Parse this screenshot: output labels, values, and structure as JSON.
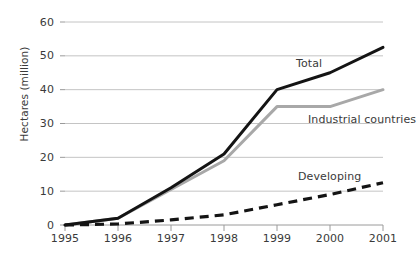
{
  "chart_data": {
    "type": "line",
    "title": "",
    "xlabel": "",
    "ylabel": "Hectares (million)",
    "x": [
      1995,
      1996,
      1997,
      1998,
      1999,
      2000,
      2001
    ],
    "xtick_labels": [
      "1995",
      "1996",
      "1997",
      "1998",
      "1999",
      "2000",
      "2001"
    ],
    "ytick_labels": [
      "0",
      "10",
      "20",
      "30",
      "40",
      "50",
      "60"
    ],
    "yticks": [
      0,
      10,
      20,
      30,
      40,
      50,
      60
    ],
    "ylim": [
      0,
      60
    ],
    "xlim": [
      1995,
      2001
    ],
    "grid": "horizontal",
    "legend": "inline-labels",
    "series": [
      {
        "name": "Total",
        "label": "Total",
        "color": "#141414",
        "style": "solid",
        "values": [
          0,
          2,
          11,
          21,
          40,
          45,
          52.5
        ]
      },
      {
        "name": "Industrial countries",
        "label": "Industrial countries",
        "color": "#a8a8a8",
        "style": "solid",
        "values": [
          0,
          2,
          10.5,
          19,
          35,
          35,
          40
        ]
      },
      {
        "name": "Developing",
        "label": "Developing",
        "color": "#141414",
        "style": "dashed",
        "values": [
          0,
          0.3,
          1.5,
          3,
          6,
          9,
          12.5
        ]
      }
    ]
  },
  "axis": {
    "grid_color": "#b5b5b5",
    "tick_color": "#9a9a9a",
    "text_color": "#3a3a3a"
  },
  "labels": {
    "total": "Total",
    "industrial": "Industrial countries",
    "developing": "Developing"
  }
}
